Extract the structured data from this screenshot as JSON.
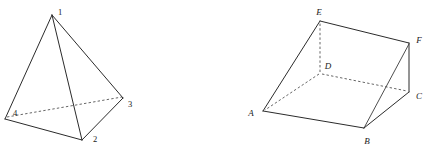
{
  "image": {
    "kind": "geometry-diagram",
    "background_color": "#ffffff",
    "line_color": "#2b2b2b",
    "hidden_line_color": "#4a4a4a",
    "label_color": "#1a1a1a",
    "width": 428,
    "height": 155
  },
  "figures": [
    {
      "id": "tetrahedron",
      "name": "Tetrahedron with numbered vertices",
      "label_style": "numeric",
      "vertices": [
        {
          "name": "1",
          "x": 52,
          "y": 14,
          "label_x": 60,
          "label_y": 12,
          "role": "apex"
        },
        {
          "name": "2",
          "x": 82,
          "y": 140,
          "label_x": 95,
          "label_y": 139,
          "role": "front-base"
        },
        {
          "name": "3",
          "x": 123,
          "y": 98,
          "label_x": 130,
          "label_y": 104,
          "role": "right-base"
        },
        {
          "name": "4",
          "x": 5,
          "y": 119,
          "label_x": 15,
          "label_y": 113,
          "role": "left-base"
        }
      ],
      "solid_edges": [
        {
          "from": "1",
          "to": "4"
        },
        {
          "from": "1",
          "to": "2"
        },
        {
          "from": "1",
          "to": "3"
        },
        {
          "from": "4",
          "to": "2"
        },
        {
          "from": "2",
          "to": "3"
        }
      ],
      "hidden_edges": [
        {
          "from": "4",
          "to": "3"
        }
      ]
    },
    {
      "id": "triangular-prism",
      "name": "Triangular prism with lettered vertices",
      "label_style": "italic-letters",
      "vertices": [
        {
          "name": "A",
          "x": 263,
          "y": 111,
          "label_x": 251,
          "label_y": 113,
          "role": "front-left-bottom"
        },
        {
          "name": "B",
          "x": 364,
          "y": 128,
          "label_x": 366,
          "label_y": 141,
          "role": "front-right-bottom"
        },
        {
          "name": "C",
          "x": 409,
          "y": 92,
          "label_x": 417,
          "label_y": 96,
          "role": "back-right-bottom"
        },
        {
          "name": "D",
          "x": 320,
          "y": 73,
          "label_x": 325,
          "label_y": 67,
          "role": "back-left-bottom"
        },
        {
          "name": "E",
          "x": 320,
          "y": 21,
          "label_x": 318,
          "label_y": 12,
          "role": "back-left-top"
        },
        {
          "name": "F",
          "x": 409,
          "y": 43,
          "label_x": 417,
          "label_y": 40,
          "role": "back-right-top"
        }
      ],
      "solid_edges": [
        {
          "from": "A",
          "to": "E"
        },
        {
          "from": "E",
          "to": "F"
        },
        {
          "from": "F",
          "to": "C"
        },
        {
          "from": "F",
          "to": "B"
        },
        {
          "from": "C",
          "to": "B"
        },
        {
          "from": "B",
          "to": "A"
        },
        {
          "from": "A",
          "to": "B"
        },
        {
          "from": "E",
          "to": "B"
        }
      ],
      "hidden_edges": [
        {
          "from": "D",
          "to": "A"
        },
        {
          "from": "D",
          "to": "E"
        },
        {
          "from": "D",
          "to": "C"
        }
      ]
    }
  ]
}
